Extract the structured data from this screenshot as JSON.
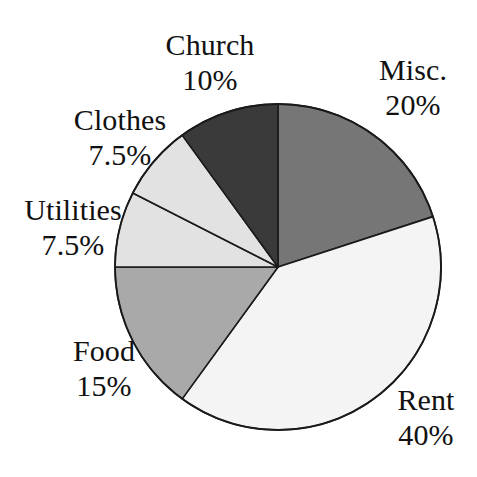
{
  "chart_data": {
    "type": "pie",
    "title": "",
    "subtitle": "",
    "xlabel": "",
    "ylabel": "",
    "legend_position": "none",
    "grid": false,
    "units": "percent",
    "total": 100,
    "start_angle_deg": 0,
    "direction": "clockwise",
    "categories": [
      "Misc.",
      "Rent",
      "Food",
      "Utilities",
      "Clothes",
      "Church"
    ],
    "values": [
      20,
      40,
      15,
      7.5,
      7.5,
      10
    ],
    "slices": [
      {
        "name": "Misc.",
        "value": 20,
        "value_label": "20%",
        "color": "#767676",
        "start_deg": 0,
        "end_deg": 72,
        "label_name": "Misc.",
        "label_value": "20%"
      },
      {
        "name": "Rent",
        "value": 40,
        "value_label": "40%",
        "color": "#f4f4f4",
        "start_deg": 72,
        "end_deg": 216,
        "label_name": "Rent",
        "label_value": "40%"
      },
      {
        "name": "Food",
        "value": 15,
        "value_label": "15%",
        "color": "#a9a9a9",
        "start_deg": 216,
        "end_deg": 270,
        "label_name": "Food",
        "label_value": "15%"
      },
      {
        "name": "Utilities",
        "value": 7.5,
        "value_label": "7.5%",
        "color": "#e2e2e2",
        "start_deg": 270,
        "end_deg": 297,
        "label_name": "Utilities",
        "label_value": "7.5%"
      },
      {
        "name": "Clothes",
        "value": 7.5,
        "value_label": "7.5%",
        "color": "#e2e2e2",
        "start_deg": 297,
        "end_deg": 324,
        "label_name": "Clothes",
        "label_value": "7.5%"
      },
      {
        "name": "Church",
        "value": 10,
        "value_label": "10%",
        "color": "#3a3a3a",
        "start_deg": 324,
        "end_deg": 360,
        "label_name": "Church",
        "label_value": "10%"
      }
    ],
    "geometry": {
      "center_x": 278,
      "center_y": 267,
      "radius": 163
    },
    "colors": {
      "background": "#ffffff",
      "outline": "#1a1a1a",
      "text": "#111111"
    }
  }
}
